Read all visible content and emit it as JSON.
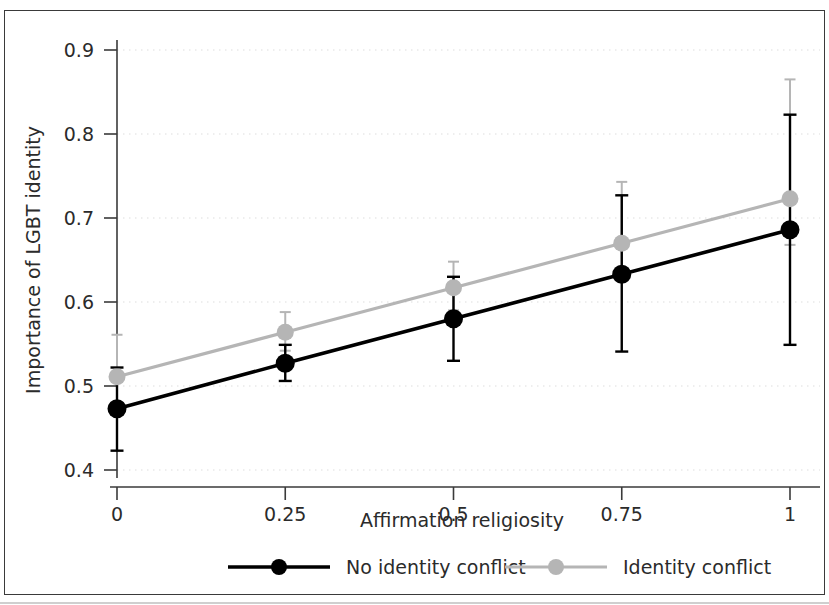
{
  "chart_data": {
    "type": "line",
    "title": "",
    "xlabel": "Affirmation religiosity",
    "ylabel": "Importance of LGBT identity",
    "x": [
      0,
      0.25,
      0.5,
      0.75,
      1
    ],
    "xtick_labels": [
      "0",
      "0.25",
      "0.5",
      "0.75",
      "1"
    ],
    "ytick_labels": [
      "0.4",
      "0.5",
      "0.6",
      "0.7",
      "0.8",
      "0.9"
    ],
    "ytick_values": [
      0.4,
      0.5,
      0.6,
      0.7,
      0.8,
      0.9
    ],
    "xlim": [
      -0.04,
      1.04
    ],
    "ylim": [
      0.365,
      0.925
    ],
    "grid": "horizontal-dotted",
    "legend_position": "bottom",
    "error_bars": "95% confidence interval",
    "series": [
      {
        "name": "No identity conflict",
        "color": "#000000",
        "marker": "filled-circle",
        "values": [
          0.473,
          0.527,
          0.58,
          0.633,
          0.686
        ],
        "ci_low": [
          0.423,
          0.506,
          0.53,
          0.541,
          0.549
        ],
        "ci_high": [
          0.522,
          0.549,
          0.63,
          0.727,
          0.823
        ]
      },
      {
        "name": "Identity conflict",
        "color": "#b5b5b5",
        "marker": "filled-circle",
        "values": [
          0.511,
          0.564,
          0.617,
          0.67,
          0.723
        ],
        "ci_low": [
          0.475,
          0.542,
          0.59,
          0.63,
          0.668
        ],
        "ci_high": [
          0.561,
          0.588,
          0.648,
          0.743,
          0.865
        ]
      }
    ]
  },
  "legend": {
    "entries": [
      {
        "label": "No identity conflict",
        "color": "#000000"
      },
      {
        "label": "Identity conflict",
        "color": "#b5b5b5"
      }
    ]
  }
}
